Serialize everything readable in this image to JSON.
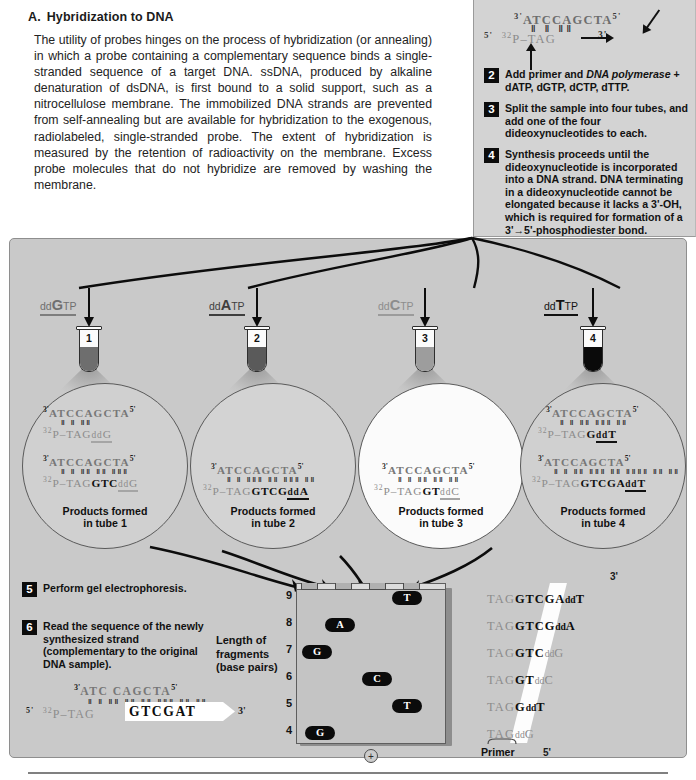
{
  "section_a": {
    "letter": "A.",
    "title": "Hybridization to DNA",
    "body": "The utility of probes hinges on the process of hybridization (or annealing) in which a probe containing a complementary sequence binds a single-stranded sequence of a target DNA. ssDNA, produced by alkaline denaturation of dsDNA, is first bound to a solid support, such as a nitrocellulose membrane. The immobilized DNA strands are prevented from self-annealing but are available for hybridization to the exogenous, radiolabeled, single-stranded probe. The extent of hybridization is measured by the retention of radioactivity on the membrane. Excess probe molecules that do not hybridize are removed by washing the membrane."
  },
  "top_right_panel": {
    "template_strand": "ATCCAGCTA",
    "template_5_label": "5'",
    "template_3_label": "3'",
    "primer_label_5": "5'",
    "primer_isotope": "32",
    "primer_prefix": "P–",
    "primer_bases": "TAG",
    "primer_3_label": "3'",
    "steps": [
      {
        "number": "2",
        "text_before_italic": "Add primer and ",
        "italic": "DNA polymerase",
        "text_after_italic": " + dATP, dGTP, dCTP, dTTP."
      },
      {
        "number": "3",
        "text": "Split the sample into four tubes, and add one of the four dideoxynucleotides to each."
      },
      {
        "number": "4",
        "text": "Synthesis proceeds until the dideoxynucleotide is incorporated into a DNA strand. DNA terminating in a dideoxynucleotide cannot be elongated because it lacks a 3'-OH, which is required for  formation of a 3'→5'-phosphodiester bond."
      }
    ]
  },
  "dd_labels": [
    {
      "dd": "dd",
      "base": "G",
      "tp": "TP",
      "color": "#6f6f6f",
      "rule_color": "#7d7d7d"
    },
    {
      "dd": "dd",
      "base": "A",
      "tp": "TP",
      "color": "#4a4a4a",
      "rule_color": "#3d3d3d"
    },
    {
      "dd": "dd",
      "base": "C",
      "tp": "TP",
      "color": "#8d8d8d",
      "rule_color": "#9b9b9b"
    },
    {
      "dd": "dd",
      "base": "T",
      "tp": "TP",
      "color": "#1a1a1a",
      "rule_color": "#111111"
    }
  ],
  "tubes": [
    {
      "number": "1",
      "liquid_color": "#6e6e6e"
    },
    {
      "number": "2",
      "liquid_color": "#5a5a5a"
    },
    {
      "number": "3",
      "liquid_color": "#9d9d9d"
    },
    {
      "number": "4",
      "liquid_color": "#0a0a0a"
    }
  ],
  "bubbles": [
    {
      "label_line1": "Products formed",
      "label_line2": "in tube 1",
      "fill": "#d0d0d0",
      "products": [
        {
          "template": "ATCCAGCTA",
          "bonds": "‖ ‖ ‖‖",
          "primer": "P–TAG",
          "synth": "",
          "term_dd": "dd",
          "term_base": "G",
          "term_faint": true
        },
        {
          "template": "ATCCAGCTA",
          "bonds": "‖ ‖ ‖‖ ‖‖ ‖‖‖",
          "primer": "P–TAG",
          "synth": "GTC",
          "term_dd": "dd",
          "term_base": "G",
          "term_faint": true
        }
      ]
    },
    {
      "label_line1": "Products formed",
      "label_line2": "in tube 2",
      "fill": "#d3d3d3",
      "products": [
        {
          "template": "ATCCAGCTA",
          "bonds": "‖ ‖ ‖‖‖ ‖‖ ‖‖‖ ‖‖",
          "primer": "P–TAG",
          "synth": "GTCG",
          "term_dd": "dd",
          "term_base": "A",
          "term_faint": false
        }
      ]
    },
    {
      "label_line1": "Products formed",
      "label_line2": "in tube 3",
      "fill": "#fbfbfb",
      "products": [
        {
          "template": "ATCCAGCTA",
          "bonds": "‖ ‖ ‖‖ ‖‖ ‖‖",
          "primer": "P–TAG",
          "synth": "GT",
          "term_dd": "dd",
          "term_base": "C",
          "term_faint": true
        }
      ]
    },
    {
      "label_line1": "Products formed",
      "label_line2": "in tube 4",
      "fill": "#d0d0d0",
      "products": [
        {
          "template": "ATCCAGCTA",
          "bonds": "‖ ‖ ‖‖ ‖‖‖ ‖‖",
          "primer": "P–TAG",
          "synth": "G",
          "term_dd": "dd",
          "term_base": "T",
          "term_faint": false
        },
        {
          "template": "ATCCAGCTA",
          "bonds": "‖ ‖ ‖‖ ‖‖‖ ‖‖ ‖‖‖‖ ‖‖ ‖‖",
          "primer": "P–TAG",
          "synth": "GTCGA",
          "term_dd": "dd",
          "term_base": "T",
          "term_faint": false
        }
      ]
    }
  ],
  "bottom_steps": [
    {
      "number": "5",
      "text": "Perform gel electrophoresis."
    },
    {
      "number": "6",
      "text": "Read the sequence of the newly synthesized strand (complementary to the original DNA sample)."
    }
  ],
  "readout": {
    "template_3": "3'",
    "template": "ATC CAGCTA",
    "template_5": "5'",
    "primer_5": "5'",
    "isotope": "32",
    "primer": "P–TAG",
    "sequence": "GTCGAT",
    "end_3": "3'"
  },
  "gel": {
    "axis_title_line1": "Length of",
    "axis_title_line2": "fragments",
    "axis_title_line3": "(base pairs)",
    "tick_labels": [
      "9",
      "8",
      "7",
      "6",
      "5",
      "4"
    ],
    "electrode_label": "+",
    "bands": [
      {
        "base": "T",
        "lane": 4,
        "length": 9
      },
      {
        "base": "A",
        "lane": 2,
        "length": 8
      },
      {
        "base": "G",
        "lane": 1,
        "length": 7
      },
      {
        "base": "C",
        "lane": 3,
        "length": 6
      },
      {
        "base": "T",
        "lane": 4,
        "length": 5
      },
      {
        "base": "G",
        "lane": 1,
        "length": 4
      }
    ]
  },
  "ladder": {
    "label_3": "3'",
    "label_5": "5'",
    "primer_label": "Primer",
    "rows": [
      {
        "primer": "TAG",
        "synth": "GTCGA",
        "dd": "dd",
        "base": "T",
        "faint": false
      },
      {
        "primer": "TAG",
        "synth": "GTCG",
        "dd": "dd",
        "base": "A",
        "faint": false
      },
      {
        "primer": "TAG",
        "synth": "GTC",
        "dd": "dd",
        "base": "G",
        "faint": true
      },
      {
        "primer": "TAG",
        "synth": "GT",
        "dd": "dd",
        "base": "C",
        "faint": true
      },
      {
        "primer": "TAG",
        "synth": "G",
        "dd": "dd",
        "base": "T",
        "faint": false
      },
      {
        "primer": "TAG",
        "synth": "",
        "dd": "dd",
        "base": "G",
        "faint": true
      }
    ]
  }
}
